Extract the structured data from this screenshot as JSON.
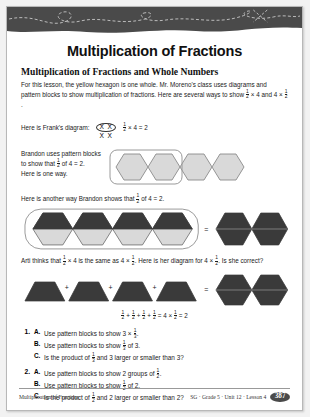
{
  "page": {
    "title": "Multiplication of Fractions",
    "subhead": "Multiplication of Fractions and Whole Numbers",
    "intro": "For this lesson, the yellow hexagon is one whole. Mr. Moreno's class uses diagrams and pattern blocks to show multiplication of fractions. Here are several ways to show ½ × 4 and 4 × ½."
  },
  "frank": {
    "label": "Here is Frank's diagram:",
    "marks_top": "X X",
    "marks_bottom": "X X",
    "equation": "½ × 4 = 2"
  },
  "brandon": {
    "text_line1": "Brandon uses pattern blocks",
    "text_line2": "to show that ½ of 4 = 2.",
    "text_line3": "Here is one way.",
    "second_caption": "Here is another way Brandon shows that ½ of 4 = 2.",
    "equals": "=",
    "hexagons_count": 4,
    "grouped_count": 2,
    "result_count": 2
  },
  "arti": {
    "caption": "Arti thinks that ½ × 4 is the same as 4 × ½. Here is her diagram for 4 × ½. Is she correct?",
    "plus": "+",
    "equals": "=",
    "trapezoid_count": 4,
    "result_count": 2,
    "equation": "½ + ½ + ½ + ½ = 4 × ½ = 2"
  },
  "questions": [
    {
      "number": "1.",
      "parts": [
        {
          "letter": "A.",
          "text": "Use pattern blocks to show 3 × ⅓."
        },
        {
          "letter": "B.",
          "text": "Use pattern blocks to show ⅓ of 3."
        },
        {
          "letter": "C.",
          "text": "Is the product of ⅓ and 3 larger or smaller than 3?"
        }
      ]
    },
    {
      "number": "2.",
      "parts": [
        {
          "letter": "A.",
          "text": "Use pattern blocks to show 2 groups of ½."
        },
        {
          "letter": "B.",
          "text": "Use pattern blocks to show ½ of 2."
        },
        {
          "letter": "C.",
          "text": "Is the product of ½ and 2 larger or smaller than 2?"
        }
      ]
    }
  ],
  "footer": {
    "left": "Multiplication of Fractions",
    "right": "SG · Grade 5 · Unit 12 · Lesson 4",
    "page_number": "387"
  },
  "colors": {
    "banner": "#4a4a4a",
    "hex_light": "#d9d9d9",
    "hex_dark": "#3a3a3a",
    "outline": "#8a8a8a"
  }
}
